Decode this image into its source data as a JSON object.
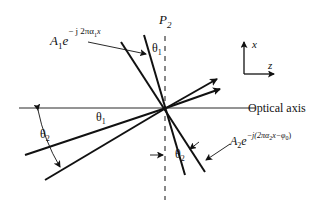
{
  "diagram": {
    "plane_label": "P",
    "plane_sub": "2",
    "axis_label": "Optical axis",
    "coord": {
      "x_label": "x",
      "z_label": "z"
    },
    "wave1": {
      "amp": "A",
      "amp_sub": "1",
      "base": "e",
      "exp": "− j 2πα",
      "exp_sub": "1",
      "exp_tail": "x"
    },
    "wave2": {
      "amp": "A",
      "amp_sub": "2",
      "base": "e",
      "exp": "−j(2πα",
      "exp_sub": "2",
      "exp_tail": "x−φ",
      "exp_sub2": "0",
      "exp_close": ")"
    },
    "angles": {
      "theta1_top": "θ",
      "theta1_top_sub": "1",
      "theta1_axis": "θ",
      "theta1_axis_sub": "1",
      "theta2_left": "θ",
      "theta2_left_sub": "2",
      "theta2_bottom": "θ",
      "theta2_bottom_sub": "2"
    },
    "colors": {
      "ink": "#111111",
      "background": "#ffffff"
    }
  }
}
